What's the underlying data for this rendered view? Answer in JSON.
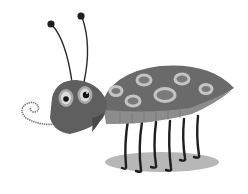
{
  "image": {
    "subject": "cartoon bug",
    "colors": {
      "background": "#ffffff",
      "body": "#6e6e6e",
      "body_dark": "#5a5a5a",
      "spot_ring": "#bdbdbd",
      "spot_center": "#777777",
      "belly": "#8a8a8a",
      "head": "#626262",
      "eye_ring": "#a8a8a8",
      "eye_white": "#e0e0e0",
      "pupil": "#1a1a1a",
      "legs": "#1e1e1e",
      "shadow": "#9a9a9a",
      "antenna": "#2a2a2a"
    }
  }
}
